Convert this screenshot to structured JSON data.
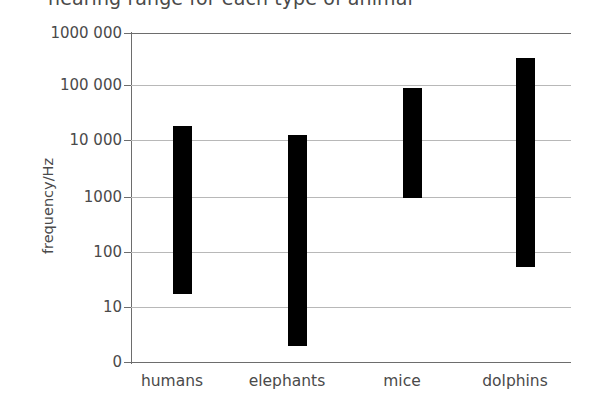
{
  "chart_data": {
    "type": "bar",
    "title": "hearing range for each type of animal",
    "xlabel": "",
    "ylabel": "frequency/Hz",
    "scale": "log",
    "grid": true,
    "legend": "none",
    "categories": [
      "humans",
      "elephants",
      "mice",
      "dolphins"
    ],
    "y_tick_labels": [
      "1000 000",
      "100 000",
      "10 000",
      "1000",
      "100",
      "10",
      "0"
    ],
    "y_tick_values": [
      1000000,
      100000,
      10000,
      1000,
      100,
      10,
      0
    ],
    "ylim": [
      0,
      1000000
    ],
    "series": [
      {
        "name": "hearing range",
        "ranges": [
          {
            "category": "humans",
            "min": 18,
            "max": 20000
          },
          {
            "category": "elephants",
            "min": 3,
            "max": 14000
          },
          {
            "category": "mice",
            "min": 1000,
            "max": 100000
          },
          {
            "category": "dolphins",
            "min": 55,
            "max": 350000
          }
        ]
      }
    ],
    "bar_color": "#000000",
    "grid_color": "#b8b8b8",
    "axis_color": "#6d6d6d"
  }
}
